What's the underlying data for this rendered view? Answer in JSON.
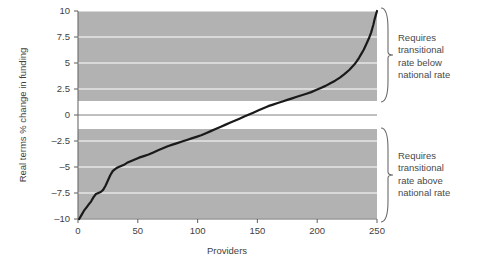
{
  "chart_data": {
    "type": "line",
    "title": "",
    "xlabel": "Providers",
    "ylabel": "Real terms % change in funding",
    "xlim": [
      0,
      250
    ],
    "ylim": [
      -10,
      10
    ],
    "xticks": [
      0,
      50,
      100,
      150,
      200,
      250
    ],
    "yticks": [
      10,
      7.5,
      5,
      2.5,
      0,
      -2.5,
      -5,
      -7.5,
      -10
    ],
    "xtick_labels": [
      "0",
      "50",
      "100",
      "150",
      "200",
      "250"
    ],
    "ytick_labels": [
      "10",
      "7.5",
      "5",
      "2.5",
      "0",
      "-2.5",
      "-5",
      "-7.5",
      "-10"
    ],
    "grid": true,
    "grid_color": "#ffffff",
    "band_color": "#b2b2b2",
    "band_ranges": [
      [
        1.35,
        10
      ],
      [
        -10,
        -1.35
      ]
    ],
    "zero_line": true,
    "legend": "none",
    "series": [
      {
        "name": "Real terms % change in funding by provider (sorted ascending)",
        "color": "#1a1a1a",
        "x": [
          1,
          3,
          5,
          7,
          9,
          11,
          13,
          15,
          17,
          19,
          21,
          23,
          25,
          27,
          29,
          31,
          33,
          35,
          37,
          39,
          41,
          43,
          45,
          47,
          49,
          51,
          55,
          59,
          63,
          67,
          71,
          75,
          79,
          83,
          87,
          91,
          95,
          99,
          103,
          107,
          111,
          115,
          119,
          123,
          127,
          131,
          135,
          139,
          143,
          147,
          151,
          155,
          159,
          163,
          167,
          171,
          175,
          179,
          183,
          187,
          191,
          195,
          199,
          203,
          207,
          211,
          215,
          219,
          223,
          227,
          231,
          233,
          235,
          237,
          239,
          241,
          243,
          245,
          246,
          247,
          248,
          249,
          250
        ],
        "y": [
          -10.0,
          -9.6,
          -9.2,
          -8.9,
          -8.6,
          -8.3,
          -7.9,
          -7.6,
          -7.5,
          -7.4,
          -7.2,
          -6.8,
          -6.3,
          -5.8,
          -5.4,
          -5.2,
          -5.05,
          -4.95,
          -4.85,
          -4.75,
          -4.6,
          -4.5,
          -4.4,
          -4.3,
          -4.2,
          -4.1,
          -3.95,
          -3.8,
          -3.6,
          -3.4,
          -3.2,
          -3.0,
          -2.85,
          -2.7,
          -2.55,
          -2.4,
          -2.25,
          -2.1,
          -1.95,
          -1.75,
          -1.55,
          -1.35,
          -1.15,
          -0.95,
          -0.75,
          -0.55,
          -0.35,
          -0.15,
          0.05,
          0.25,
          0.45,
          0.65,
          0.85,
          1.0,
          1.15,
          1.3,
          1.45,
          1.6,
          1.75,
          1.9,
          2.05,
          2.2,
          2.4,
          2.6,
          2.8,
          3.05,
          3.3,
          3.6,
          3.95,
          4.35,
          4.85,
          5.15,
          5.5,
          5.9,
          6.3,
          6.8,
          7.3,
          7.9,
          8.3,
          8.7,
          9.2,
          9.6,
          10.0
        ]
      }
    ],
    "annotations": [
      {
        "id": "upper-bracket",
        "text": "Requires\ntransitional\nrate below\nnational rate",
        "lines": [
          "Requires",
          "transitional",
          "rate below",
          "national rate"
        ],
        "range_y": [
          1.35,
          10
        ]
      },
      {
        "id": "lower-bracket",
        "text": "Requires\ntransitional\nrate above\nnational rate",
        "lines": [
          "Requires",
          "transitional",
          "rate above",
          "national rate"
        ],
        "range_y": [
          -10,
          -1.35
        ]
      }
    ]
  },
  "axes": {
    "x_title": "Providers",
    "y_title": "Real terms % change in funding"
  }
}
